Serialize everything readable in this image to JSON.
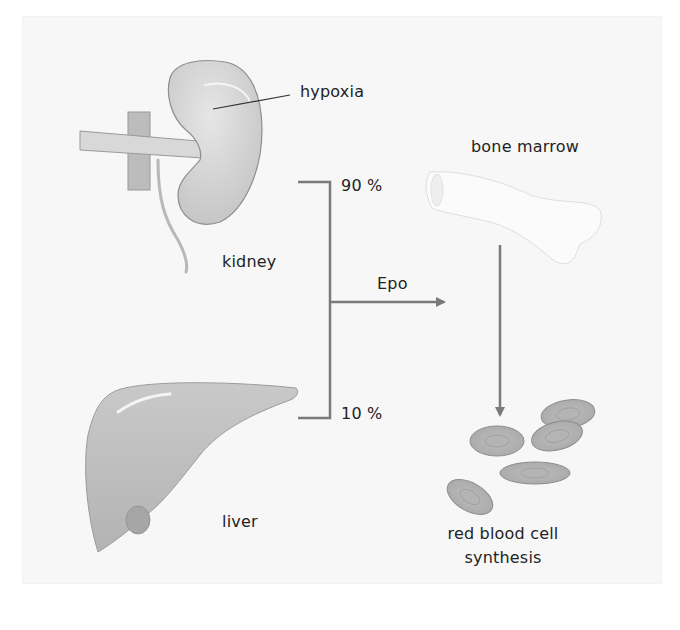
{
  "diagram": {
    "title": "",
    "colors": {
      "background": "#ffffff",
      "panel": "#f7f7f7",
      "organ_fill": "#c8c8c8",
      "organ_stroke": "#8e8e8e",
      "line": "#7a7a7a",
      "text": "#232323"
    },
    "labels": {
      "hypoxia": "hypoxia",
      "kidney": "kidney",
      "liver": "liver",
      "bone_marrow": "bone marrow",
      "epo": "Epo",
      "kidney_percent": "90 %",
      "liver_percent": "10 %",
      "rbc_line1": "red blood cell",
      "rbc_line2": "synthesis"
    },
    "nodes": [
      {
        "id": "kidney",
        "label": "kidney",
        "icon": "kidney-illustration"
      },
      {
        "id": "liver",
        "label": "liver",
        "icon": "liver-illustration"
      },
      {
        "id": "bone_marrow",
        "label": "bone marrow",
        "icon": "bone-illustration"
      },
      {
        "id": "rbc",
        "label": "red blood cell synthesis",
        "icon": "red-blood-cells-illustration"
      }
    ],
    "edges": [
      {
        "from": "kidney",
        "to": "bone_marrow",
        "label": "Epo",
        "share": "90 %"
      },
      {
        "from": "liver",
        "to": "bone_marrow",
        "label": "Epo",
        "share": "10 %"
      },
      {
        "from": "bone_marrow",
        "to": "rbc",
        "label": ""
      }
    ],
    "annotations": [
      {
        "target": "kidney",
        "text": "hypoxia"
      }
    ]
  }
}
